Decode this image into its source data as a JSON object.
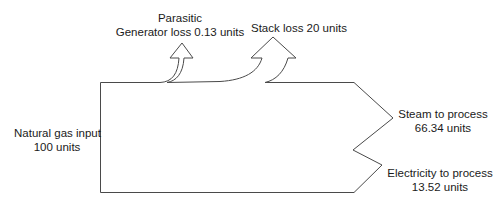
{
  "diagram": {
    "type": "sankey",
    "title": "",
    "colors": {
      "stroke": "#4a4a4a",
      "text": "#1a1a1a",
      "background": "#ffffff"
    },
    "input": {
      "label": "Natural gas input",
      "value": "100 units"
    },
    "losses": [
      {
        "id": "parasitic",
        "label_line1": "Parasitic",
        "label_line2": "Generator loss  0.13 units"
      },
      {
        "id": "stack",
        "label": "Stack loss  20 units"
      }
    ],
    "outputs": [
      {
        "id": "steam",
        "label": "Steam to process",
        "value": "66.34 units"
      },
      {
        "id": "electricity",
        "label": "Electricity to process",
        "value": "13.52 units"
      }
    ]
  }
}
